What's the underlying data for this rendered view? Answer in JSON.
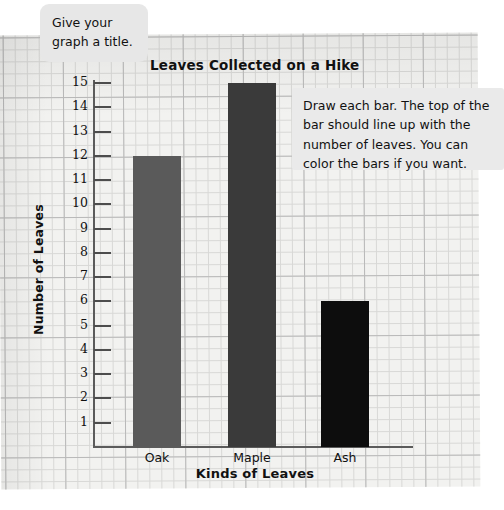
{
  "worksheet": {
    "paper_color": "#f2f2f0",
    "grid_line_color": "#d8d8d6"
  },
  "callouts": [
    {
      "id": "title-hint",
      "lines": [
        "Give your",
        "graph a title."
      ]
    },
    {
      "id": "bars-hint",
      "lines": [
        "Draw each bar. The top of the",
        "bar should line up with the",
        "number of leaves. You can",
        "color the bars if you want."
      ]
    }
  ],
  "chart_data": {
    "type": "bar",
    "title": "Leaves Collected on a Hike",
    "xlabel": "Kinds of Leaves",
    "ylabel": "Number of Leaves",
    "categories": [
      "Oak",
      "Maple",
      "Ash"
    ],
    "values": [
      12,
      15,
      6
    ],
    "bar_colors": [
      "#5a5a5a",
      "#3a3a3a",
      "#0d0d0d"
    ],
    "ylim": [
      0,
      15
    ],
    "ytick_labels": [
      "15",
      "14",
      "13",
      "12",
      "11",
      "10",
      "9",
      "8",
      "7",
      "6",
      "5",
      "4",
      "3",
      "2",
      "1"
    ],
    "ytick_values": [
      15,
      14,
      13,
      12,
      11,
      10,
      9,
      8,
      7,
      6,
      5,
      4,
      3,
      2,
      1
    ],
    "grid": true,
    "legend": "none",
    "axis_color": "#5b5b5b"
  }
}
